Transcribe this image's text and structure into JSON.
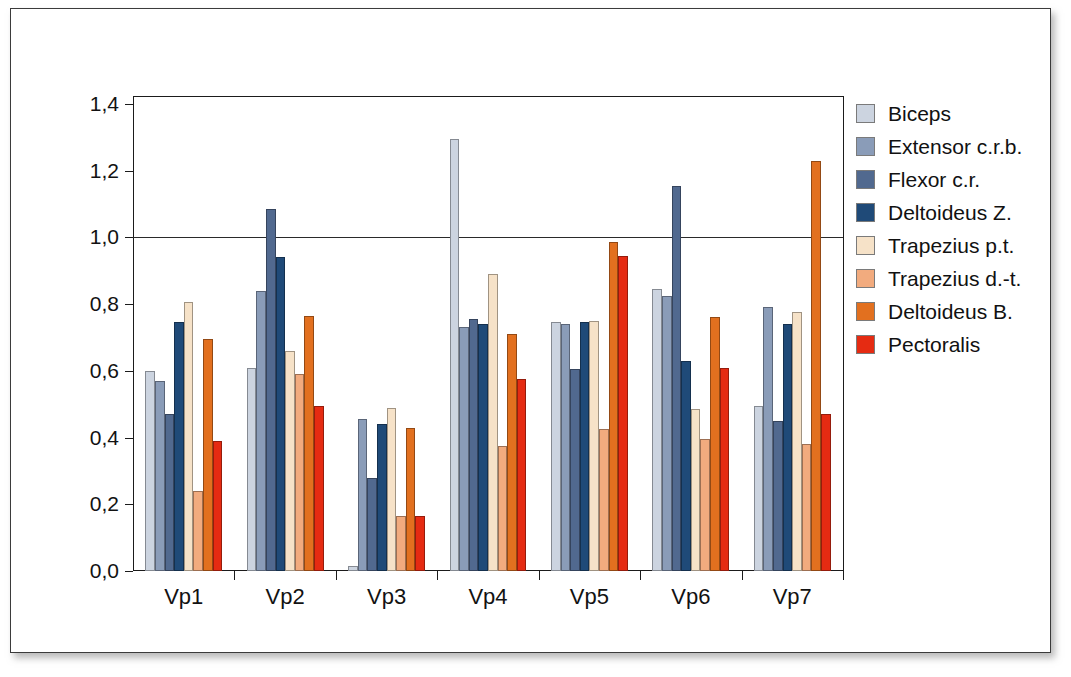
{
  "chart_data": {
    "type": "bar",
    "title": "",
    "subtitle": "",
    "xlabel": "",
    "ylabel": "",
    "categories": [
      "Vp1",
      "Vp2",
      "Vp3",
      "Vp4",
      "Vp5",
      "Vp6",
      "Vp7"
    ],
    "ylim": [
      0.0,
      1.4
    ],
    "ytick_values": [
      0.0,
      0.2,
      0.4,
      0.6,
      0.8,
      1.0,
      1.2,
      1.4
    ],
    "ytick_labels": [
      "0,0",
      "0,2",
      "0,4",
      "0,6",
      "0,8",
      "1,0",
      "1,2",
      "1,4"
    ],
    "gridlines_at": [
      1.0
    ],
    "grid": false,
    "legend_position": "right",
    "decimal_separator": ",",
    "series": [
      {
        "name": "Biceps",
        "color": "#ccd4e0",
        "values": [
          0.6,
          0.61,
          0.015,
          1.295,
          0.745,
          0.845,
          0.495
        ]
      },
      {
        "name": "Extensor c.r.b.",
        "color": "#8a9cb8",
        "values": [
          0.57,
          0.84,
          0.455,
          0.73,
          0.74,
          0.825,
          0.79
        ]
      },
      {
        "name": "Flexor c.r.",
        "color": "#51698f",
        "values": [
          0.47,
          1.085,
          0.28,
          0.755,
          0.605,
          1.155,
          0.45
        ]
      },
      {
        "name": "Deltoideus Z.",
        "color": "#1f4a78",
        "values": [
          0.745,
          0.94,
          0.44,
          0.74,
          0.745,
          0.63,
          0.74
        ]
      },
      {
        "name": "Trapezius p.t.",
        "color": "#f6e2c8",
        "values": [
          0.805,
          0.66,
          0.49,
          0.89,
          0.75,
          0.485,
          0.775
        ]
      },
      {
        "name": "Trapezius d.-t.",
        "color": "#f2ab7e",
        "values": [
          0.24,
          0.59,
          0.165,
          0.375,
          0.425,
          0.395,
          0.38
        ]
      },
      {
        "name": "Deltoideus B.",
        "color": "#e2701f",
        "values": [
          0.695,
          0.765,
          0.43,
          0.71,
          0.985,
          0.76,
          1.23
        ]
      },
      {
        "name": "Pectoralis",
        "color": "#e52b12",
        "values": [
          0.39,
          0.495,
          0.165,
          0.575,
          0.945,
          0.61,
          0.47
        ]
      }
    ]
  }
}
